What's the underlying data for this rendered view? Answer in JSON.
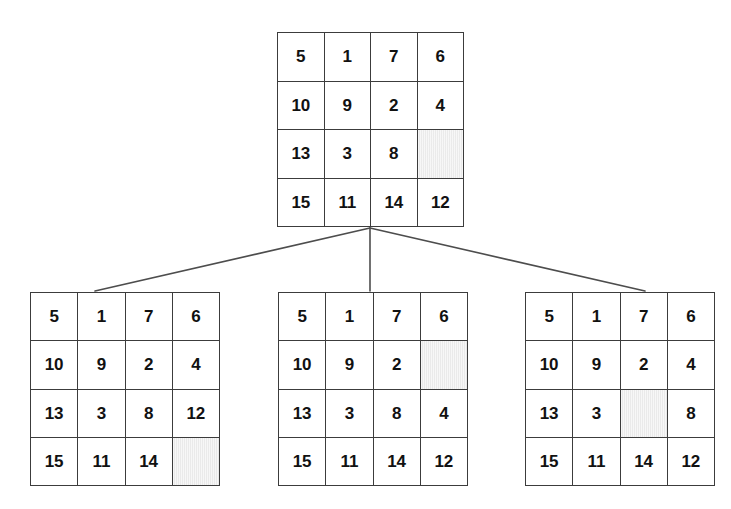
{
  "figure": {
    "type": "search-tree-diagram",
    "rows": 4,
    "columns": 4,
    "blank_label": "",
    "colors": {
      "background": "#ffffff",
      "grid_line": "#3c3c3c",
      "cell_fill": "#ffffff",
      "blank_cell_fill": "#ededed",
      "edge_line": "#4d4d4d",
      "text": "#111111"
    },
    "caption": ""
  },
  "nodes": [
    {
      "id": "root",
      "name": "root-state",
      "blank_position": {
        "row": 3,
        "col": 4
      },
      "rows": [
        [
          "5",
          "1",
          "7",
          "6"
        ],
        [
          "10",
          "9",
          "2",
          "4"
        ],
        [
          "13",
          "3",
          "8",
          ""
        ],
        [
          "15",
          "11",
          "14",
          "12"
        ]
      ]
    },
    {
      "id": "child-0",
      "name": "successor-state-left",
      "blank_position": {
        "row": 4,
        "col": 4
      },
      "rows": [
        [
          "5",
          "1",
          "7",
          "6"
        ],
        [
          "10",
          "9",
          "2",
          "4"
        ],
        [
          "13",
          "3",
          "8",
          "12"
        ],
        [
          "15",
          "11",
          "14",
          ""
        ]
      ]
    },
    {
      "id": "child-1",
      "name": "successor-state-middle",
      "blank_position": {
        "row": 2,
        "col": 4
      },
      "rows": [
        [
          "5",
          "1",
          "7",
          "6"
        ],
        [
          "10",
          "9",
          "2",
          ""
        ],
        [
          "13",
          "3",
          "8",
          "4"
        ],
        [
          "15",
          "11",
          "14",
          "12"
        ]
      ]
    },
    {
      "id": "child-2",
      "name": "successor-state-right",
      "blank_position": {
        "row": 3,
        "col": 3
      },
      "rows": [
        [
          "5",
          "1",
          "7",
          "6"
        ],
        [
          "10",
          "9",
          "2",
          "4"
        ],
        [
          "13",
          "3",
          "",
          "8"
        ],
        [
          "15",
          "11",
          "14",
          "12"
        ]
      ]
    }
  ],
  "edges": [
    {
      "from": "root",
      "to": "child-0",
      "x1": 370,
      "y1": 228,
      "x2": 95,
      "y2": 291
    },
    {
      "from": "root",
      "to": "child-1",
      "x1": 370,
      "y1": 228,
      "x2": 370,
      "y2": 291
    },
    {
      "from": "root",
      "to": "child-2",
      "x1": 370,
      "y1": 228,
      "x2": 645,
      "y2": 291
    }
  ]
}
